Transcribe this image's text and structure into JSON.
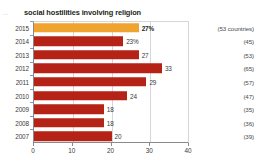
{
  "title": {
    "prefix": "...",
    "main": "social hostilities involving religion"
  },
  "colors": {
    "highlight": "#F0A32E",
    "bar": "#B52316",
    "axis": "#8a8a8a",
    "grid": "#d6d6d6",
    "text": "#3a3a3a"
  },
  "chart_data": {
    "type": "bar",
    "orientation": "horizontal",
    "title": "social hostilities involving religion",
    "xlabel": "",
    "ylabel": "",
    "xlim": [
      0,
      40
    ],
    "xticks": [
      0,
      10,
      20,
      30,
      40
    ],
    "grid": true,
    "legend": null,
    "categories": [
      "2015",
      "2014",
      "2013",
      "2012",
      "2011",
      "2010",
      "2009",
      "2008",
      "2007"
    ],
    "values": [
      27,
      23,
      27,
      33,
      29,
      24,
      18,
      18,
      20
    ],
    "data_labels": [
      "27%",
      "23%",
      "27",
      "33",
      "29",
      "24",
      "18",
      "18",
      "20"
    ],
    "annotations": [
      "(53 countries)",
      "(45)",
      "(53)",
      "(65)",
      "(57)",
      "(47)",
      "(35)",
      "(36)",
      "(39)"
    ],
    "highlight_index": 0
  },
  "rows": [
    {
      "year": "2015",
      "value": 27,
      "label": "27%",
      "count": "(53 countries)",
      "highlight": true
    },
    {
      "year": "2014",
      "value": 23,
      "label": "23%",
      "count": "(45)",
      "highlight": false
    },
    {
      "year": "2013",
      "value": 27,
      "label": "27",
      "count": "(53)",
      "highlight": false
    },
    {
      "year": "2012",
      "value": 33,
      "label": "33",
      "count": "(65)",
      "highlight": false
    },
    {
      "year": "2011",
      "value": 29,
      "label": "29",
      "count": "(57)",
      "highlight": false
    },
    {
      "year": "2010",
      "value": 24,
      "label": "24",
      "count": "(47)",
      "highlight": false
    },
    {
      "year": "2009",
      "value": 18,
      "label": "18",
      "count": "(35)",
      "highlight": false
    },
    {
      "year": "2008",
      "value": 18,
      "label": "18",
      "count": "(36)",
      "highlight": false
    },
    {
      "year": "2007",
      "value": 20,
      "label": "20",
      "count": "(39)",
      "highlight": false
    }
  ],
  "xticks": [
    {
      "label": "0",
      "value": 0
    },
    {
      "label": "10",
      "value": 10
    },
    {
      "label": "20",
      "value": 20
    },
    {
      "label": "30",
      "value": 30
    },
    {
      "label": "40",
      "value": 40
    }
  ]
}
